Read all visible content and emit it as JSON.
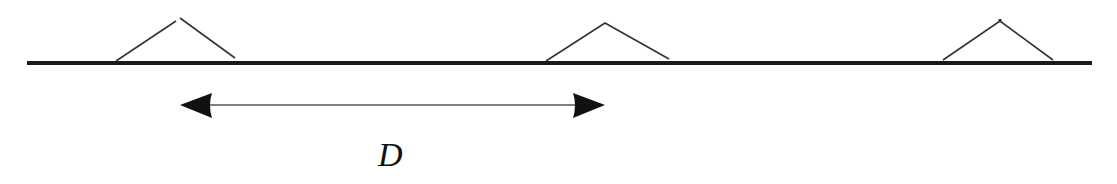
{
  "diagram": {
    "type": "spacing-diagram",
    "baseline": {
      "x1": 27,
      "x2": 1092,
      "y": 63,
      "color": "#1a1a1a"
    },
    "markers": [
      {
        "id": "marker-1",
        "left_x": 116,
        "apex_x": 178,
        "right_x": 235,
        "apex_y": 19,
        "base_y": 59
      },
      {
        "id": "marker-2",
        "left_x": 546,
        "apex_x": 605,
        "right_x": 669,
        "apex_y": 23,
        "base_y": 61
      },
      {
        "id": "marker-3",
        "left_x": 943,
        "apex_x": 1000,
        "right_x": 1053,
        "apex_y": 21,
        "base_y": 60
      }
    ],
    "dimension_arrow": {
      "x1": 180,
      "x2": 605,
      "y": 105,
      "label": "D",
      "arrowheads": "both",
      "color": "#111111"
    },
    "colors": {
      "line": "#1a1a1a",
      "chevron": "#333333",
      "background": "#ffffff"
    }
  }
}
